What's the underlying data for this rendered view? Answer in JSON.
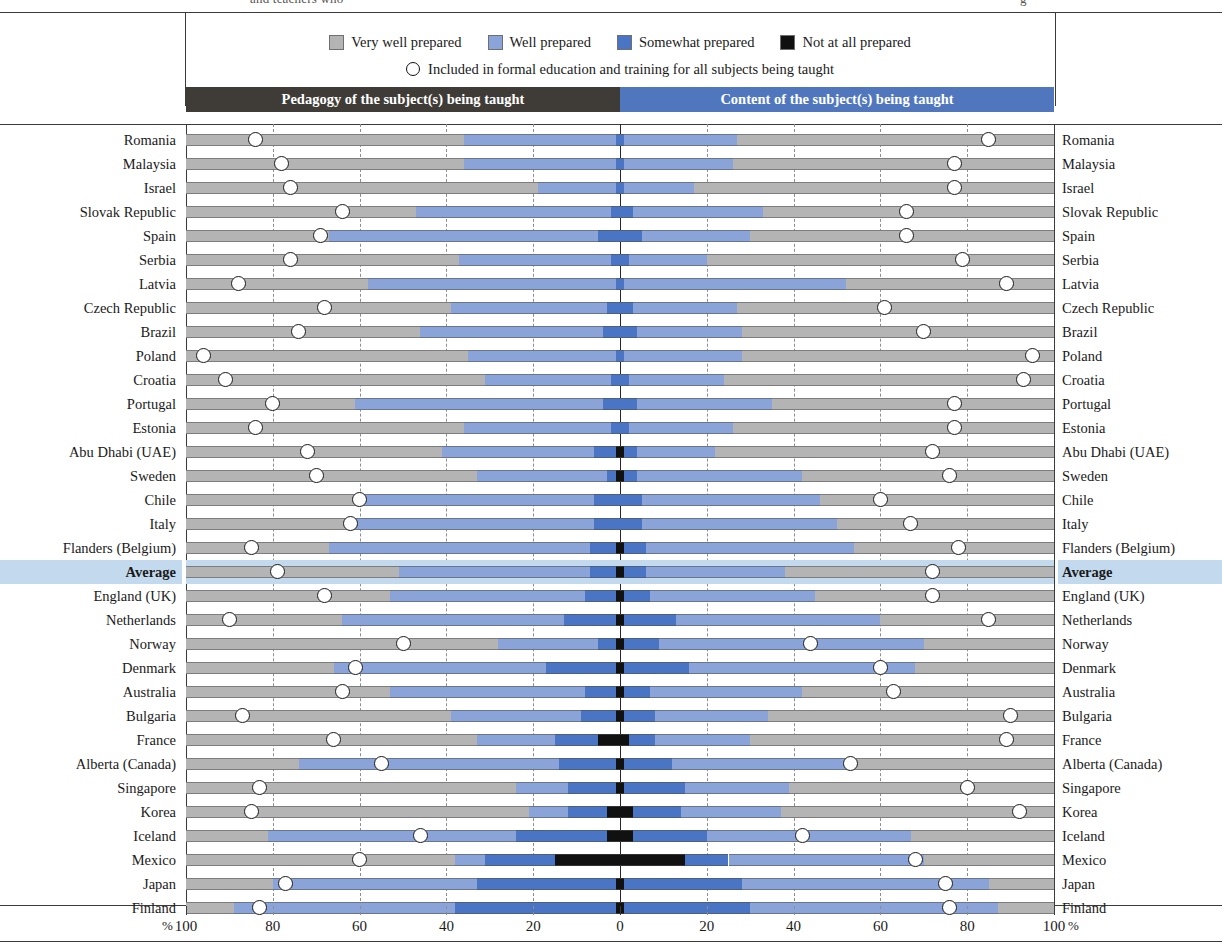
{
  "cut_caption": {
    "left_fragment": "and teachers who",
    "right_fragment": "g"
  },
  "legend": {
    "items": [
      {
        "label": "Very well prepared",
        "color": "#b4b4b4",
        "icon": "square-swatch-icon"
      },
      {
        "label": "Well prepared",
        "color": "#8aa4da",
        "icon": "square-swatch-icon"
      },
      {
        "label": "Somewhat prepared",
        "color": "#4a74c4",
        "icon": "square-swatch-icon"
      },
      {
        "label": "Not at all prepared",
        "color": "#111111",
        "icon": "square-swatch-icon"
      }
    ],
    "marker_note": "Included in formal education and training for all subjects being taught",
    "marker_icon": "open-circle-marker-icon"
  },
  "panels": {
    "left_title": "Pedagogy of the subject(s) being taught",
    "right_title": "Content of the subject(s) being taught",
    "left_bg": "#3f3c38",
    "right_bg": "#5077bd"
  },
  "axis": {
    "tick_labels": [
      "100",
      "80",
      "60",
      "40",
      "20",
      "0",
      "20",
      "40",
      "60",
      "80",
      "100"
    ],
    "percent_left": "%",
    "percent_right": "%"
  },
  "highlight_row": "Average",
  "highlight_color": "#c3d9ee",
  "chart_data": {
    "type": "bar",
    "subtype": "diverging-100pct-stacked-horizontal",
    "xlabel": "%",
    "ylabel": "",
    "xlim": [
      -100,
      100
    ],
    "grid": true,
    "gridlines_every": 20,
    "legend_position": "top",
    "series_order": [
      "Very well prepared",
      "Well prepared",
      "Somewhat prepared",
      "Not at all prepared"
    ],
    "series_colors": {
      "Very well prepared": "#b4b4b4",
      "Well prepared": "#8aa4da",
      "Somewhat prepared": "#4a74c4",
      "Not at all prepared": "#111111"
    },
    "marker_series": {
      "name": "Included in formal education and training for all subjects being taught",
      "style": "open-circle"
    },
    "panels": [
      "Pedagogy of the subject(s) being taught",
      "Content of the subject(s) being taught"
    ],
    "categories": [
      "Romania",
      "Malaysia",
      "Israel",
      "Slovak Republic",
      "Spain",
      "Serbia",
      "Latvia",
      "Czech Republic",
      "Brazil",
      "Poland",
      "Croatia",
      "Portugal",
      "Estonia",
      "Abu Dhabi (UAE)",
      "Sweden",
      "Chile",
      "Italy",
      "Flanders (Belgium)",
      "Average",
      "England (UK)",
      "Netherlands",
      "Norway",
      "Denmark",
      "Australia",
      "Bulgaria",
      "France",
      "Alberta (Canada)",
      "Singapore",
      "Korea",
      "Iceland",
      "Mexico",
      "Japan",
      "Finland"
    ],
    "rows": [
      {
        "country": "Romania",
        "pedagogy": {
          "very_well": 64,
          "well": 35,
          "somewhat": 1,
          "not_at_all": 0,
          "marker": 84
        },
        "content": {
          "very_well": 73,
          "well": 26,
          "somewhat": 1,
          "not_at_all": 0,
          "marker": 85
        }
      },
      {
        "country": "Malaysia",
        "pedagogy": {
          "very_well": 64,
          "well": 35,
          "somewhat": 1,
          "not_at_all": 0,
          "marker": 78
        },
        "content": {
          "very_well": 74,
          "well": 25,
          "somewhat": 1,
          "not_at_all": 0,
          "marker": 77
        }
      },
      {
        "country": "Israel",
        "pedagogy": {
          "very_well": 81,
          "well": 18,
          "somewhat": 1,
          "not_at_all": 0,
          "marker": 76
        },
        "content": {
          "very_well": 83,
          "well": 16,
          "somewhat": 1,
          "not_at_all": 0,
          "marker": 77
        }
      },
      {
        "country": "Slovak Republic",
        "pedagogy": {
          "very_well": 53,
          "well": 45,
          "somewhat": 2,
          "not_at_all": 0,
          "marker": 64
        },
        "content": {
          "very_well": 67,
          "well": 30,
          "somewhat": 3,
          "not_at_all": 0,
          "marker": 66
        }
      },
      {
        "country": "Spain",
        "pedagogy": {
          "very_well": 33,
          "well": 62,
          "somewhat": 5,
          "not_at_all": 0,
          "marker": 69
        },
        "content": {
          "very_well": 70,
          "well": 25,
          "somewhat": 5,
          "not_at_all": 0,
          "marker": 66
        }
      },
      {
        "country": "Serbia",
        "pedagogy": {
          "very_well": 63,
          "well": 35,
          "somewhat": 2,
          "not_at_all": 0,
          "marker": 76
        },
        "content": {
          "very_well": 80,
          "well": 18,
          "somewhat": 2,
          "not_at_all": 0,
          "marker": 79
        }
      },
      {
        "country": "Latvia",
        "pedagogy": {
          "very_well": 42,
          "well": 57,
          "somewhat": 1,
          "not_at_all": 0,
          "marker": 88
        },
        "content": {
          "very_well": 48,
          "well": 51,
          "somewhat": 1,
          "not_at_all": 0,
          "marker": 89
        }
      },
      {
        "country": "Czech Republic",
        "pedagogy": {
          "very_well": 61,
          "well": 36,
          "somewhat": 3,
          "not_at_all": 0,
          "marker": 68
        },
        "content": {
          "very_well": 73,
          "well": 24,
          "somewhat": 3,
          "not_at_all": 0,
          "marker": 61
        }
      },
      {
        "country": "Brazil",
        "pedagogy": {
          "very_well": 54,
          "well": 42,
          "somewhat": 4,
          "not_at_all": 0,
          "marker": 74
        },
        "content": {
          "very_well": 72,
          "well": 24,
          "somewhat": 4,
          "not_at_all": 0,
          "marker": 70
        }
      },
      {
        "country": "Poland",
        "pedagogy": {
          "very_well": 65,
          "well": 34,
          "somewhat": 1,
          "not_at_all": 0,
          "marker": 96
        },
        "content": {
          "very_well": 72,
          "well": 27,
          "somewhat": 1,
          "not_at_all": 0,
          "marker": 95
        }
      },
      {
        "country": "Croatia",
        "pedagogy": {
          "very_well": 69,
          "well": 29,
          "somewhat": 2,
          "not_at_all": 0,
          "marker": 91
        },
        "content": {
          "very_well": 76,
          "well": 22,
          "somewhat": 2,
          "not_at_all": 0,
          "marker": 93
        }
      },
      {
        "country": "Portugal",
        "pedagogy": {
          "very_well": 39,
          "well": 57,
          "somewhat": 4,
          "not_at_all": 0,
          "marker": 80
        },
        "content": {
          "very_well": 65,
          "well": 31,
          "somewhat": 4,
          "not_at_all": 0,
          "marker": 77
        }
      },
      {
        "country": "Estonia",
        "pedagogy": {
          "very_well": 64,
          "well": 34,
          "somewhat": 2,
          "not_at_all": 0,
          "marker": 84
        },
        "content": {
          "very_well": 74,
          "well": 24,
          "somewhat": 2,
          "not_at_all": 0,
          "marker": 77
        }
      },
      {
        "country": "Abu Dhabi (UAE)",
        "pedagogy": {
          "very_well": 59,
          "well": 35,
          "somewhat": 5,
          "not_at_all": 1,
          "marker": 72
        },
        "content": {
          "very_well": 78,
          "well": 18,
          "somewhat": 3,
          "not_at_all": 1,
          "marker": 72
        }
      },
      {
        "country": "Sweden",
        "pedagogy": {
          "very_well": 67,
          "well": 30,
          "somewhat": 2,
          "not_at_all": 1,
          "marker": 70
        },
        "content": {
          "very_well": 58,
          "well": 38,
          "somewhat": 3,
          "not_at_all": 1,
          "marker": 76
        }
      },
      {
        "country": "Chile",
        "pedagogy": {
          "very_well": 40,
          "well": 54,
          "somewhat": 6,
          "not_at_all": 0,
          "marker": 60
        },
        "content": {
          "very_well": 54,
          "well": 41,
          "somewhat": 5,
          "not_at_all": 0,
          "marker": 60
        }
      },
      {
        "country": "Italy",
        "pedagogy": {
          "very_well": 38,
          "well": 56,
          "somewhat": 6,
          "not_at_all": 0,
          "marker": 62
        },
        "content": {
          "very_well": 50,
          "well": 45,
          "somewhat": 5,
          "not_at_all": 0,
          "marker": 67
        }
      },
      {
        "country": "Flanders (Belgium)",
        "pedagogy": {
          "very_well": 33,
          "well": 60,
          "somewhat": 6,
          "not_at_all": 1,
          "marker": 85
        },
        "content": {
          "very_well": 46,
          "well": 48,
          "somewhat": 5,
          "not_at_all": 1,
          "marker": 78
        }
      },
      {
        "country": "Average",
        "pedagogy": {
          "very_well": 49,
          "well": 44,
          "somewhat": 6,
          "not_at_all": 1,
          "marker": 79
        },
        "content": {
          "very_well": 62,
          "well": 32,
          "somewhat": 5,
          "not_at_all": 1,
          "marker": 72
        }
      },
      {
        "country": "England (UK)",
        "pedagogy": {
          "very_well": 47,
          "well": 45,
          "somewhat": 7,
          "not_at_all": 1,
          "marker": 68
        },
        "content": {
          "very_well": 55,
          "well": 38,
          "somewhat": 6,
          "not_at_all": 1,
          "marker": 72
        }
      },
      {
        "country": "Netherlands",
        "pedagogy": {
          "very_well": 36,
          "well": 51,
          "somewhat": 12,
          "not_at_all": 1,
          "marker": 90
        },
        "content": {
          "very_well": 40,
          "well": 47,
          "somewhat": 12,
          "not_at_all": 1,
          "marker": 85
        }
      },
      {
        "country": "Norway",
        "pedagogy": {
          "very_well": 72,
          "well": 23,
          "somewhat": 4,
          "not_at_all": 1,
          "marker": 50
        },
        "content": {
          "very_well": 30,
          "well": 61,
          "somewhat": 8,
          "not_at_all": 1,
          "marker": 44
        }
      },
      {
        "country": "Denmark",
        "pedagogy": {
          "very_well": 34,
          "well": 49,
          "somewhat": 16,
          "not_at_all": 1,
          "marker": 61
        },
        "content": {
          "very_well": 32,
          "well": 52,
          "somewhat": 15,
          "not_at_all": 1,
          "marker": 60
        }
      },
      {
        "country": "Australia",
        "pedagogy": {
          "very_well": 47,
          "well": 45,
          "somewhat": 7,
          "not_at_all": 1,
          "marker": 64
        },
        "content": {
          "very_well": 58,
          "well": 35,
          "somewhat": 6,
          "not_at_all": 1,
          "marker": 63
        }
      },
      {
        "country": "Bulgaria",
        "pedagogy": {
          "very_well": 61,
          "well": 30,
          "somewhat": 8,
          "not_at_all": 1,
          "marker": 87
        },
        "content": {
          "very_well": 66,
          "well": 26,
          "somewhat": 7,
          "not_at_all": 1,
          "marker": 90
        }
      },
      {
        "country": "France",
        "pedagogy": {
          "very_well": 67,
          "well": 18,
          "somewhat": 10,
          "not_at_all": 5,
          "marker": 66
        },
        "content": {
          "very_well": 70,
          "well": 22,
          "somewhat": 6,
          "not_at_all": 2,
          "marker": 89
        }
      },
      {
        "country": "Alberta (Canada)",
        "pedagogy": {
          "very_well": 26,
          "well": 60,
          "somewhat": 13,
          "not_at_all": 1,
          "marker": 55
        },
        "content": {
          "very_well": 46,
          "well": 42,
          "somewhat": 11,
          "not_at_all": 1,
          "marker": 53
        }
      },
      {
        "country": "Singapore",
        "pedagogy": {
          "very_well": 76,
          "well": 12,
          "somewhat": 11,
          "not_at_all": 1,
          "marker": 83
        },
        "content": {
          "very_well": 61,
          "well": 24,
          "somewhat": 14,
          "not_at_all": 1,
          "marker": 80
        }
      },
      {
        "country": "Korea",
        "pedagogy": {
          "very_well": 79,
          "well": 9,
          "somewhat": 9,
          "not_at_all": 3,
          "marker": 85
        },
        "content": {
          "very_well": 63,
          "well": 23,
          "somewhat": 11,
          "not_at_all": 3,
          "marker": 92
        }
      },
      {
        "country": "Iceland",
        "pedagogy": {
          "very_well": 19,
          "well": 57,
          "somewhat": 21,
          "not_at_all": 3,
          "marker": 46
        },
        "content": {
          "very_well": 33,
          "well": 47,
          "somewhat": 17,
          "not_at_all": 3,
          "marker": 42
        }
      },
      {
        "country": "Mexico",
        "pedagogy": {
          "very_well": 62,
          "well": 7,
          "somewhat": 16,
          "not_at_all": 15,
          "marker": 60
        },
        "content": {
          "very_well": 30,
          "well": 45,
          "somewhat": 10,
          "not_at_all": 15,
          "marker": 68
        }
      },
      {
        "country": "Japan",
        "pedagogy": {
          "very_well": 20,
          "well": 47,
          "somewhat": 32,
          "not_at_all": 1,
          "marker": 77
        },
        "content": {
          "very_well": 15,
          "well": 57,
          "somewhat": 27,
          "not_at_all": 1,
          "marker": 75
        }
      },
      {
        "country": "Finland",
        "pedagogy": {
          "very_well": 11,
          "well": 51,
          "somewhat": 37,
          "not_at_all": 1,
          "marker": 83
        },
        "content": {
          "very_well": 13,
          "well": 57,
          "somewhat": 29,
          "not_at_all": 1,
          "marker": 76
        }
      }
    ]
  }
}
